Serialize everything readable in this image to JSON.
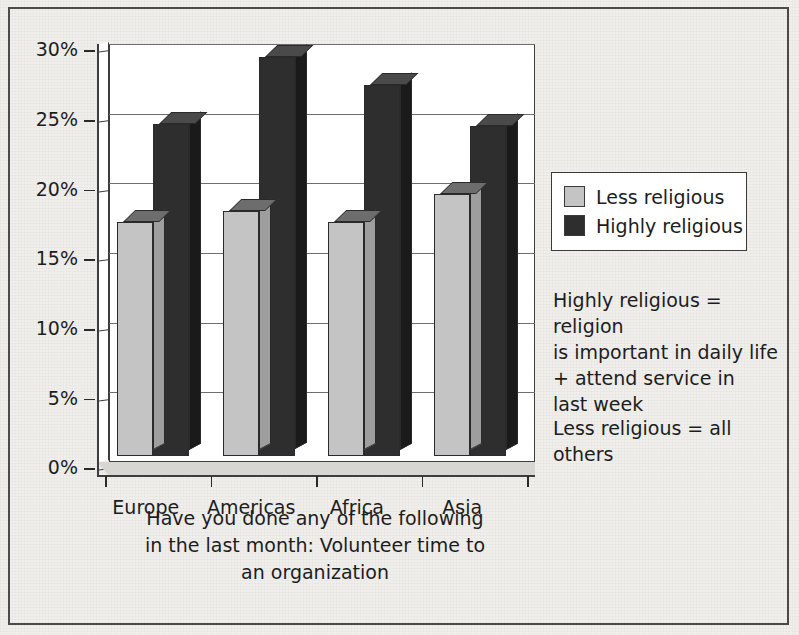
{
  "chart_data": {
    "type": "bar",
    "title": "",
    "categories": [
      "Europe",
      "Americas",
      "Africa",
      "Asia"
    ],
    "series": [
      {
        "name": "Less religious",
        "color": "#c4c4c4",
        "values": [
          16.8,
          17.6,
          16.8,
          18.8
        ]
      },
      {
        "name": "Highly religious",
        "color": "#2e2e2e",
        "values": [
          23.8,
          28.6,
          26.6,
          23.7
        ]
      }
    ],
    "xlabel": "Have you done any of the following in the last month: Volunteer time to an organization",
    "ylabel": "",
    "ylim": [
      0,
      30
    ],
    "ytick_values": [
      0,
      5,
      10,
      15,
      20,
      25,
      30
    ],
    "ytick_labels": [
      "0%",
      "5%",
      "10%",
      "15%",
      "20%",
      "25%",
      "30%"
    ],
    "grid": true,
    "legend_position": "right",
    "annotations": [
      "Highly religious = religion is important in daily life + attend service in last week",
      "Less religious = all others"
    ]
  },
  "axis": {
    "ticks": [
      {
        "label": "30%",
        "value": 30
      },
      {
        "label": "25%",
        "value": 25
      },
      {
        "label": "20%",
        "value": 20
      },
      {
        "label": "15%",
        "value": 15
      },
      {
        "label": "10%",
        "value": 10
      },
      {
        "label": "5%",
        "value": 5
      },
      {
        "label": "0%",
        "value": 0
      }
    ]
  },
  "categories": [
    {
      "label": "Europe"
    },
    {
      "label": "Americas"
    },
    {
      "label": "Africa"
    },
    {
      "label": "Asia"
    }
  ],
  "legend": {
    "items": [
      {
        "label": "Less religious",
        "swatch": "light"
      },
      {
        "label": "Highly religious",
        "swatch": "dark"
      }
    ]
  },
  "caption": {
    "line1": "Have you done any of the following",
    "line2": "in the last month: Volunteer time to",
    "line3": "an organization"
  },
  "notes": {
    "highly": {
      "line1": "Highly religious = religion",
      "line2": "is important in daily life",
      "line3": "+ attend service in",
      "line4": "last week"
    },
    "less": {
      "line1": "Less religious = all others"
    }
  },
  "colors": {
    "less_religious": "#c4c4c4",
    "highly_religious": "#2e2e2e",
    "background": "#f0efec",
    "plot_background": "#ffffff",
    "frame": "#4b4b4b"
  }
}
